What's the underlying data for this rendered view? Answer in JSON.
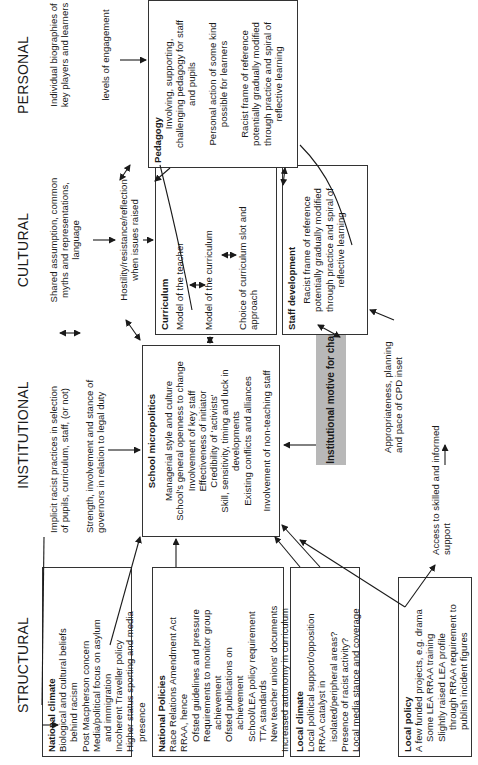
{
  "columns": {
    "structural": "STRUCTURAL",
    "institutional": "INSTITUTIONAL",
    "cultural": "CULTURAL",
    "personal": "PERSONAL"
  },
  "structural": {
    "national_climate": {
      "title": "National climate",
      "lines": [
        "Biological and cultural beliefs",
        "behind racism",
        "Post Macpherson concern",
        "Media/political focus on asylum",
        "and immigration",
        "Incoherent Traveller policy",
        "Higher status sporting and media",
        "presence"
      ]
    },
    "national_policies": {
      "title": "National Policies",
      "lines": [
        "Race Relations Amendment Act",
        "RRAA, hence",
        "Ofsted guidelines and pressure",
        "Requirements to monitor group",
        "achievement",
        "Ofsted publications on",
        "achievement",
        "School/LEA policy requirement",
        "TTA standards",
        "New teacher unions' documents",
        "Increased autonomy in curriculum"
      ]
    },
    "local_climate": {
      "title": "Local climate",
      "lines": [
        "Local political support/opposition",
        "RRAA catalyst in",
        "isolated/peripheral areas?",
        "Presence of racist activity?",
        "Local media stance and coverage"
      ]
    },
    "local_policy": {
      "title": "Local policy",
      "lines": [
        "A few funded projects, e.g. drama",
        "Some LEA RRAA training",
        "Slightly raised LEA profile",
        "through RRAA requirement to",
        "publish incident figures"
      ]
    }
  },
  "institutional": {
    "note_implicit": [
      "Implicit racist practices in selection",
      "of pupils, curriculum, staff, (or not)"
    ],
    "note_governors": [
      "Strength, involvement and stance of",
      "governors in relation to legal duty"
    ],
    "micropolitics": {
      "title": "School micropolitics",
      "lines": [
        "Managerial style and culture",
        "School's general openness to change",
        "Involvement of key staff",
        "Effectiveness of initiator",
        "Credibility of 'activists'",
        "Skill, sensitivity, timing and luck in",
        "developments",
        "Existing conflicts and alliances",
        "",
        "Involvement of non-teaching staff"
      ]
    },
    "motive": "Institutional motive for change",
    "note_cpd": [
      "Appropriateness, planning",
      "and pace of CPD inset"
    ],
    "note_support": [
      "Access to skilled and informed",
      "support"
    ]
  },
  "cultural": {
    "note_shared": [
      "Shared assumption, common",
      "myths and representations,",
      "language"
    ],
    "note_hostility": [
      "Hostility/resistance/reflection",
      "when issues raised"
    ],
    "curriculum": {
      "title": "Curriculum",
      "lines": [
        "Model of the teacher",
        "Model of the curriculum",
        "Choice of curriculum slot and",
        "approach"
      ]
    },
    "staff_development": {
      "title": "Staff development",
      "lines": [
        "Racist frame of reference",
        "potentially gradually modified",
        "through practice and spiral of",
        "reflective learning"
      ]
    }
  },
  "personal": {
    "note_biographies": [
      "Individual biographies of",
      "key players and learners"
    ],
    "note_engagement": "levels of engagement",
    "pedagogy": {
      "title": "Pedagogy",
      "lines": [
        "Involving, supporting,",
        "challenging pedagogy for staff",
        "and pupils",
        "",
        "Personal action of some kind",
        "possible for learners",
        "",
        "Racist frame of reference",
        "potentially gradually modified",
        "through practice and spiral of",
        "reflective learning"
      ]
    }
  },
  "colors": {
    "motive_fill": "#b8b8b8",
    "border": "#333333",
    "text": "#1a1a1a"
  }
}
